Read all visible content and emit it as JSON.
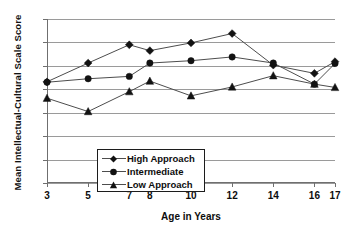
{
  "chart_data": {
    "type": "line",
    "title": "",
    "xlabel": "Age in Years",
    "ylabel": "Mean Intellectual-Cultural Scale Score",
    "x": [
      3,
      5,
      7,
      8,
      10,
      12,
      14,
      16,
      17
    ],
    "xtick_labels": [
      "3",
      "5",
      "7",
      "8",
      "10",
      "12",
      "14",
      "16",
      "17"
    ],
    "ytick_labels": [
      "9",
      "8",
      "7",
      "6",
      "5",
      "4",
      "3",
      "2"
    ],
    "ylim": [
      2,
      9
    ],
    "xlim": [
      3,
      17
    ],
    "grid": true,
    "legend_position": "lower-left-inside",
    "series": [
      {
        "name": "High Approach",
        "marker": "diamond",
        "values": [
          6.32,
          7.12,
          7.9,
          7.65,
          7.98,
          8.38,
          7.03,
          6.68,
          7.18
        ]
      },
      {
        "name": "Intermediate",
        "marker": "circle",
        "values": [
          6.3,
          6.45,
          6.55,
          7.12,
          7.22,
          7.38,
          7.12,
          6.22,
          7.1
        ]
      },
      {
        "name": "Low Approach",
        "marker": "triangle",
        "values": [
          5.62,
          5.05,
          5.9,
          6.35,
          5.72,
          6.1,
          6.58,
          6.22,
          6.08
        ]
      }
    ]
  },
  "legend": {
    "items": [
      {
        "label": "High Approach",
        "marker": "diamond"
      },
      {
        "label": "Intermediate",
        "marker": "circle"
      },
      {
        "label": "Low Approach",
        "marker": "triangle"
      }
    ]
  }
}
